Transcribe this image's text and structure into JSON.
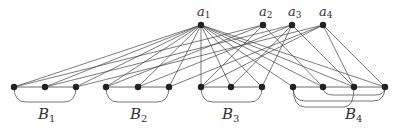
{
  "diagram": {
    "top_nodes": [
      {
        "id": "a1",
        "label": "a",
        "sub": "1",
        "x": 201,
        "y": 25
      },
      {
        "id": "a2",
        "label": "a",
        "sub": "2",
        "x": 263,
        "y": 25
      },
      {
        "id": "a3",
        "label": "a",
        "sub": "3",
        "x": 292,
        "y": 25
      },
      {
        "id": "a4",
        "label": "a",
        "sub": "4",
        "x": 323,
        "y": 25
      }
    ],
    "bottom_nodes": [
      {
        "id": "v1",
        "x": 14
      },
      {
        "id": "v2",
        "x": 45
      },
      {
        "id": "v3",
        "x": 76
      },
      {
        "id": "v4",
        "x": 106
      },
      {
        "id": "v5",
        "x": 138
      },
      {
        "id": "v6",
        "x": 169
      },
      {
        "id": "v7",
        "x": 201
      },
      {
        "id": "v8",
        "x": 231
      },
      {
        "id": "v9",
        "x": 262
      },
      {
        "id": "v10",
        "x": 293
      },
      {
        "id": "v11",
        "x": 323
      },
      {
        "id": "v12",
        "x": 354
      },
      {
        "id": "v13",
        "x": 385
      }
    ],
    "bottom_y": 87,
    "groups": [
      {
        "label": "B",
        "sub": "1",
        "from": 0,
        "to": 2,
        "lx": 38
      },
      {
        "label": "B",
        "sub": "2",
        "from": 3,
        "to": 5,
        "lx": 130
      },
      {
        "label": "B",
        "sub": "3",
        "from": 6,
        "to": 8,
        "lx": 222
      },
      {
        "label": "B",
        "sub": "4",
        "from": 9,
        "to": 12,
        "lx": 345
      }
    ],
    "edges": [
      [
        "a1",
        0
      ],
      [
        "a1",
        1
      ],
      [
        "a1",
        2
      ],
      [
        "a1",
        3
      ],
      [
        "a1",
        4
      ],
      [
        "a1",
        5
      ],
      [
        "a1",
        6
      ],
      [
        "a1",
        7
      ],
      [
        "a1",
        8
      ],
      [
        "a1",
        9
      ],
      [
        "a1",
        10
      ],
      [
        "a1",
        11
      ],
      [
        "a1",
        12
      ],
      [
        "a2",
        0
      ],
      [
        "a2",
        3
      ],
      [
        "a2",
        6
      ],
      [
        "a2",
        10
      ],
      [
        "a3",
        1
      ],
      [
        "a3",
        4
      ],
      [
        "a3",
        7
      ],
      [
        "a3",
        8
      ],
      [
        "a3",
        11
      ],
      [
        "a4",
        2
      ],
      [
        "a4",
        5
      ],
      [
        "a4",
        6
      ],
      [
        "a4",
        11
      ],
      [
        "a4",
        12
      ]
    ]
  }
}
